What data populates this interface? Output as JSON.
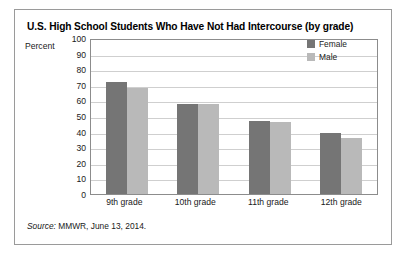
{
  "figure": {
    "title": "U.S. High School Students Who Have Not Had Intercourse (by grade)",
    "percent_label": "Percent",
    "source_prefix": "Source:",
    "source_text": " MMWR, June 13, 2014."
  },
  "legend": {
    "position": "top-right",
    "entries": [
      {
        "label": "Female",
        "color": "#757575"
      },
      {
        "label": "Male",
        "color": "#b9b9b9"
      }
    ]
  },
  "chart_data": {
    "type": "bar",
    "title": "U.S. High School Students Who Have Not Had Intercourse (by grade)",
    "xlabel": "",
    "ylabel": "Percent",
    "ylim": [
      0,
      100
    ],
    "yticks": [
      0,
      10,
      20,
      30,
      40,
      50,
      60,
      70,
      80,
      90,
      100
    ],
    "ytick_labels": [
      "0",
      "10",
      "20",
      "30",
      "40",
      "50",
      "60",
      "70",
      "80",
      "90",
      "100"
    ],
    "grid": true,
    "categories": [
      "9th grade",
      "10th grade",
      "11th grade",
      "12th grade"
    ],
    "series": [
      {
        "name": "Female",
        "color": "#757575",
        "values": [
          72,
          58,
          47,
          39
        ]
      },
      {
        "name": "Male",
        "color": "#b9b9b9",
        "values": [
          68,
          58,
          46,
          36
        ]
      }
    ],
    "annotations": [
      "Source: MMWR, June 13, 2014."
    ]
  }
}
